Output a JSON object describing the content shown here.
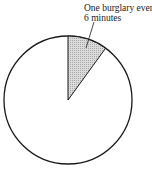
{
  "chart_data": {
    "type": "pie",
    "title": "",
    "slices": [
      {
        "label": "One burglary every 6 minutes",
        "value": 6,
        "fill": "#d0d0d0",
        "hatched": true
      },
      {
        "label": "",
        "value": 54,
        "fill": "#ffffff"
      }
    ],
    "total": 60,
    "start_angle_deg": 0,
    "direction": "clockwise",
    "annotations": [
      {
        "text_lines": [
          "One burglary every",
          "6 minutes"
        ],
        "points_to": "slice-0"
      }
    ]
  },
  "annotation": {
    "line1": "One burglary every",
    "line2": "6 minutes"
  },
  "colors": {
    "outline": "#1a1a1a",
    "slice_fill": "#d0d0d0",
    "background": "#ffffff"
  }
}
